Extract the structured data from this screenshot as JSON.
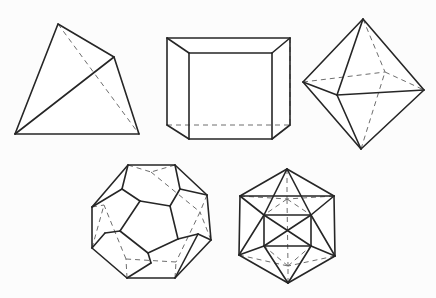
{
  "figure": {
    "background_color": "#fcfcfc",
    "visible_edge_color": "#262626",
    "hidden_edge_color": "#6e6e6e",
    "hidden_edge_style": "dashed",
    "width": 436,
    "height": 298,
    "solid_count": 5
  },
  "solids": [
    {
      "name": "tetrahedron",
      "label": "Tetrahedron",
      "faces": 4,
      "vertices": 4,
      "edges": 6,
      "face_shape": "triangle",
      "row": 1,
      "position": "top-left",
      "points": {
        "apex": [
          58,
          24
        ],
        "right": [
          114,
          57
        ],
        "bottom_left": [
          15,
          134
        ],
        "bottom_right": [
          139,
          134
        ]
      },
      "visible_edges": [
        [
          "apex",
          "right"
        ],
        [
          "apex",
          "bottom_left"
        ],
        [
          "right",
          "bottom_right"
        ],
        [
          "right",
          "bottom_left"
        ],
        [
          "bottom_left",
          "bottom_right"
        ]
      ],
      "hidden_edges": [
        [
          "apex",
          "bottom_right"
        ]
      ]
    },
    {
      "name": "cube",
      "label": "Cube (hexahedron)",
      "faces": 6,
      "vertices": 8,
      "edges": 12,
      "face_shape": "square",
      "row": 1,
      "position": "top-center",
      "points": {
        "front_top_left": [
          189,
          53
        ],
        "front_top_right": [
          272,
          53
        ],
        "front_bottom_right": [
          272,
          139
        ],
        "front_bottom_left": [
          189,
          139
        ],
        "back_top_left": [
          167,
          38
        ],
        "back_top_right": [
          290,
          38
        ],
        "back_bottom_right": [
          290,
          125
        ],
        "back_bottom_left": [
          167,
          125
        ]
      },
      "visible_edges": [
        [
          "front_top_left",
          "front_top_right"
        ],
        [
          "front_top_right",
          "front_bottom_right"
        ],
        [
          "front_bottom_right",
          "front_bottom_left"
        ],
        [
          "front_bottom_left",
          "front_top_left"
        ],
        [
          "back_top_left",
          "back_top_right"
        ],
        [
          "back_top_left",
          "back_bottom_left"
        ],
        [
          "back_top_right",
          "back_bottom_right"
        ],
        [
          "back_bottom_right",
          "front_bottom_right"
        ],
        [
          "front_top_left",
          "back_top_left"
        ],
        [
          "front_top_right",
          "back_top_right"
        ],
        [
          "front_bottom_left",
          "back_bottom_left"
        ]
      ],
      "hidden_edges": [
        [
          "back_bottom_left",
          "back_bottom_right"
        ],
        [
          "back_top_right",
          "back_bottom_right"
        ],
        [
          "front_bottom_right",
          "back_bottom_right"
        ]
      ]
    },
    {
      "name": "octahedron",
      "label": "Octahedron",
      "faces": 8,
      "vertices": 6,
      "edges": 12,
      "face_shape": "triangle",
      "row": 1,
      "position": "top-right",
      "points": {
        "top": [
          363,
          19
        ],
        "bottom": [
          361,
          149
        ],
        "left": [
          303,
          82
        ],
        "right": [
          424,
          90
        ],
        "front": [
          337,
          95
        ],
        "back": [
          385,
          72
        ]
      },
      "visible_edges": [
        [
          "top",
          "left"
        ],
        [
          "top",
          "right"
        ],
        [
          "top",
          "front"
        ],
        [
          "bottom",
          "left"
        ],
        [
          "bottom",
          "right"
        ],
        [
          "bottom",
          "front"
        ],
        [
          "left",
          "front"
        ],
        [
          "front",
          "right"
        ]
      ],
      "hidden_edges": [
        [
          "top",
          "back"
        ],
        [
          "bottom",
          "back"
        ],
        [
          "left",
          "back"
        ],
        [
          "back",
          "right"
        ]
      ]
    },
    {
      "name": "dodecahedron",
      "label": "Dodecahedron",
      "faces": 12,
      "vertices": 20,
      "edges": 30,
      "face_shape": "pentagon",
      "row": 2,
      "position": "bottom-left",
      "points": {
        "outer_1": [
          128,
          165
        ],
        "outer_2": [
          175,
          165
        ],
        "outer_3": [
          207,
          195
        ],
        "outer_4": [
          211,
          240
        ],
        "outer_5": [
          175,
          278
        ],
        "outer_6": [
          127,
          278
        ],
        "outer_7": [
          92,
          248
        ],
        "outer_8": [
          92,
          207
        ],
        "mid_1": [
          122,
          189
        ],
        "mid_2": [
          180,
          189
        ],
        "mid_3": [
          198,
          234
        ],
        "mid_4": [
          151,
          263
        ],
        "mid_5": [
          105,
          233
        ],
        "front_1": [
          140,
          201
        ],
        "front_2": [
          170,
          206
        ],
        "front_3": [
          178,
          239
        ],
        "front_4": [
          148,
          253
        ],
        "front_5": [
          120,
          231
        ],
        "hidden_a": [
          151,
          172
        ],
        "hidden_b": [
          200,
          212
        ],
        "hidden_c": [
          176,
          262
        ],
        "hidden_d": [
          126,
          259
        ],
        "hidden_e": [
          104,
          205
        ]
      },
      "visible_edges": [
        [
          "outer_1",
          "outer_2"
        ],
        [
          "outer_2",
          "outer_3"
        ],
        [
          "outer_3",
          "outer_4"
        ],
        [
          "outer_4",
          "outer_5"
        ],
        [
          "outer_5",
          "outer_6"
        ],
        [
          "outer_6",
          "outer_7"
        ],
        [
          "outer_7",
          "outer_8"
        ],
        [
          "outer_8",
          "outer_1"
        ],
        [
          "outer_1",
          "mid_1"
        ],
        [
          "outer_2",
          "mid_2"
        ],
        [
          "outer_3",
          "mid_2"
        ],
        [
          "outer_4",
          "mid_3"
        ],
        [
          "outer_5",
          "mid_3"
        ],
        [
          "outer_6",
          "mid_4"
        ],
        [
          "outer_7",
          "mid_5"
        ],
        [
          "outer_8",
          "mid_1"
        ],
        [
          "mid_1",
          "front_1"
        ],
        [
          "mid_2",
          "front_2"
        ],
        [
          "mid_3",
          "front_3"
        ],
        [
          "mid_4",
          "front_4"
        ],
        [
          "mid_5",
          "front_5"
        ],
        [
          "front_1",
          "front_2"
        ],
        [
          "front_2",
          "front_3"
        ],
        [
          "front_3",
          "front_4"
        ],
        [
          "front_4",
          "front_5"
        ],
        [
          "front_5",
          "front_1"
        ]
      ],
      "hidden_edges": [
        [
          "outer_1",
          "hidden_a"
        ],
        [
          "outer_2",
          "hidden_a"
        ],
        [
          "outer_3",
          "hidden_b"
        ],
        [
          "outer_4",
          "hidden_b"
        ],
        [
          "outer_5",
          "hidden_c"
        ],
        [
          "outer_6",
          "hidden_d"
        ],
        [
          "outer_7",
          "hidden_e"
        ],
        [
          "outer_8",
          "hidden_e"
        ],
        [
          "hidden_a",
          "hidden_b"
        ],
        [
          "hidden_b",
          "hidden_c"
        ],
        [
          "hidden_c",
          "hidden_d"
        ],
        [
          "hidden_d",
          "hidden_e"
        ]
      ]
    },
    {
      "name": "icosahedron",
      "label": "Icosahedron",
      "faces": 20,
      "vertices": 12,
      "edges": 30,
      "face_shape": "triangle",
      "row": 2,
      "position": "bottom-right",
      "points": {
        "top": [
          287,
          169
        ],
        "bottom": [
          288,
          283
        ],
        "hex_1": [
          240,
          196
        ],
        "hex_2": [
          334,
          196
        ],
        "hex_3": [
          335,
          256
        ],
        "hex_4": [
          288,
          283
        ],
        "hex_5": [
          239,
          255
        ],
        "upper_left": [
          264,
          215
        ],
        "upper_right": [
          311,
          215
        ],
        "lower_left": [
          264,
          246
        ],
        "lower_right": [
          311,
          246
        ],
        "back_upper": [
          287,
          199
        ],
        "back_lower": [
          288,
          266
        ]
      },
      "visible_edges": [
        [
          "top",
          "hex_1"
        ],
        [
          "top",
          "hex_2"
        ],
        [
          "hex_1",
          "hex_2"
        ],
        [
          "hex_1",
          "hex_5"
        ],
        [
          "hex_2",
          "hex_3"
        ],
        [
          "hex_5",
          "bottom"
        ],
        [
          "hex_3",
          "bottom"
        ],
        [
          "top",
          "upper_left"
        ],
        [
          "top",
          "upper_right"
        ],
        [
          "upper_left",
          "upper_right"
        ],
        [
          "hex_1",
          "upper_left"
        ],
        [
          "hex_2",
          "upper_right"
        ],
        [
          "upper_left",
          "lower_left"
        ],
        [
          "upper_right",
          "lower_right"
        ],
        [
          "upper_left",
          "lower_right"
        ],
        [
          "upper_right",
          "lower_left"
        ],
        [
          "lower_left",
          "lower_right"
        ],
        [
          "hex_5",
          "upper_left"
        ],
        [
          "hex_3",
          "upper_right"
        ],
        [
          "hex_5",
          "lower_left"
        ],
        [
          "hex_3",
          "lower_right"
        ],
        [
          "bottom",
          "lower_left"
        ],
        [
          "bottom",
          "lower_right"
        ]
      ],
      "hidden_edges": [
        [
          "hex_1",
          "back_upper"
        ],
        [
          "hex_2",
          "back_upper"
        ],
        [
          "top",
          "back_upper"
        ],
        [
          "back_upper",
          "upper_left"
        ],
        [
          "back_upper",
          "upper_right"
        ],
        [
          "hex_5",
          "back_lower"
        ],
        [
          "hex_3",
          "back_lower"
        ],
        [
          "bottom",
          "back_lower"
        ],
        [
          "back_lower",
          "lower_left"
        ],
        [
          "back_lower",
          "lower_right"
        ],
        [
          "back_upper",
          "back_lower"
        ]
      ]
    }
  ]
}
